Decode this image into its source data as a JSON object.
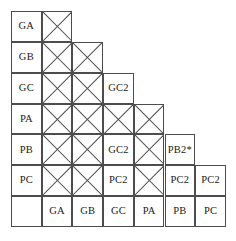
{
  "figure": {
    "name": "stair-step-comparison-matrix",
    "grid_columns": 7,
    "grid_rows": 7,
    "cell_width": 30.7,
    "cell_height": 30.85,
    "line_color": "#4d4d4d",
    "text_color": "#1a1a1a",
    "background": "#ffffff"
  },
  "row_labels": [
    "GA",
    "GB",
    "GC",
    "PA",
    "PB",
    "PC",
    ""
  ],
  "column_labels": [
    "",
    "GA",
    "GB",
    "GC",
    "PA",
    "PB",
    "PC"
  ],
  "cells": [
    {
      "row": 0,
      "col": 0,
      "type": "row-label",
      "text": "GA"
    },
    {
      "row": 0,
      "col": 1,
      "type": "x",
      "text": ""
    },
    {
      "row": 1,
      "col": 0,
      "type": "row-label",
      "text": "GB"
    },
    {
      "row": 1,
      "col": 1,
      "type": "x",
      "text": ""
    },
    {
      "row": 1,
      "col": 2,
      "type": "x",
      "text": ""
    },
    {
      "row": 2,
      "col": 0,
      "type": "row-label",
      "text": "GC"
    },
    {
      "row": 2,
      "col": 1,
      "type": "x",
      "text": ""
    },
    {
      "row": 2,
      "col": 2,
      "type": "x",
      "text": ""
    },
    {
      "row": 2,
      "col": 3,
      "type": "text",
      "text": "GC2"
    },
    {
      "row": 3,
      "col": 0,
      "type": "row-label",
      "text": "PA"
    },
    {
      "row": 3,
      "col": 1,
      "type": "x",
      "text": ""
    },
    {
      "row": 3,
      "col": 2,
      "type": "x",
      "text": ""
    },
    {
      "row": 3,
      "col": 3,
      "type": "x",
      "text": ""
    },
    {
      "row": 3,
      "col": 4,
      "type": "x",
      "text": ""
    },
    {
      "row": 4,
      "col": 0,
      "type": "row-label",
      "text": "PB"
    },
    {
      "row": 4,
      "col": 1,
      "type": "x",
      "text": ""
    },
    {
      "row": 4,
      "col": 2,
      "type": "x",
      "text": ""
    },
    {
      "row": 4,
      "col": 3,
      "type": "text",
      "text": "GC2"
    },
    {
      "row": 4,
      "col": 4,
      "type": "x",
      "text": ""
    },
    {
      "row": 4,
      "col": 5,
      "type": "text",
      "text": "PB2*"
    },
    {
      "row": 5,
      "col": 0,
      "type": "row-label",
      "text": "PC"
    },
    {
      "row": 5,
      "col": 1,
      "type": "x",
      "text": ""
    },
    {
      "row": 5,
      "col": 2,
      "type": "x",
      "text": ""
    },
    {
      "row": 5,
      "col": 3,
      "type": "text",
      "text": "PC2"
    },
    {
      "row": 5,
      "col": 4,
      "type": "x",
      "text": ""
    },
    {
      "row": 5,
      "col": 5,
      "type": "text",
      "text": "PC2"
    },
    {
      "row": 5,
      "col": 6,
      "type": "text",
      "text": "PC2"
    },
    {
      "row": 6,
      "col": 0,
      "type": "corner",
      "text": ""
    },
    {
      "row": 6,
      "col": 1,
      "type": "col-label",
      "text": "GA"
    },
    {
      "row": 6,
      "col": 2,
      "type": "col-label",
      "text": "GB"
    },
    {
      "row": 6,
      "col": 3,
      "type": "col-label",
      "text": "GC"
    },
    {
      "row": 6,
      "col": 4,
      "type": "col-label",
      "text": "PA"
    },
    {
      "row": 6,
      "col": 5,
      "type": "col-label",
      "text": "PB"
    },
    {
      "row": 6,
      "col": 6,
      "type": "col-label",
      "text": "PC"
    }
  ]
}
